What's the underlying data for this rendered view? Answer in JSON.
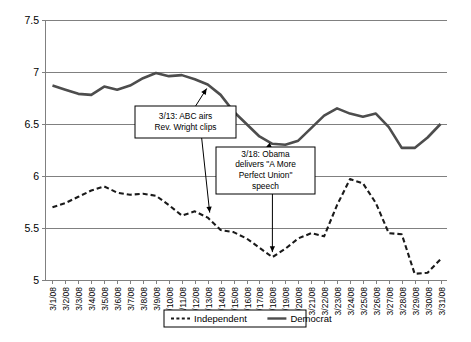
{
  "chart_data": {
    "type": "line",
    "title": "",
    "xlabel": "",
    "ylabel": "",
    "ylim": [
      5,
      7.5
    ],
    "ytick_step": 0.5,
    "yticks": [
      "5",
      "5.5",
      "6",
      "6.5",
      "7",
      "7.5"
    ],
    "grid": true,
    "legend_position": "bottom",
    "categories": [
      "3/1/08",
      "3/2/08",
      "3/3/08",
      "3/4/08",
      "3/5/08",
      "3/6/08",
      "3/7/08",
      "3/8/08",
      "3/9/08",
      "3/10/08",
      "3/11/08",
      "3/12/08",
      "3/13/08",
      "3/14/08",
      "3/15/08",
      "3/16/08",
      "3/17/08",
      "3/18/08",
      "3/19/08",
      "3/20/08",
      "3/21/08",
      "3/22/08",
      "3/23/08",
      "3/24/08",
      "3/25/08",
      "3/26/08",
      "3/27/08",
      "3/28/08",
      "3/29/08",
      "3/30/08",
      "3/31/08"
    ],
    "series": [
      {
        "name": "Independent",
        "style": "dashed",
        "color": "#1a1a1a",
        "values": [
          5.7,
          5.74,
          5.8,
          5.86,
          5.9,
          5.84,
          5.82,
          5.83,
          5.81,
          5.72,
          5.62,
          5.66,
          5.6,
          5.48,
          5.46,
          5.4,
          5.31,
          5.22,
          5.3,
          5.4,
          5.45,
          5.42,
          5.72,
          5.97,
          5.93,
          5.74,
          5.45,
          5.44,
          5.06,
          5.07,
          5.2
        ]
      },
      {
        "name": "Democrat",
        "style": "solid",
        "color": "#4d4d4d",
        "values": [
          6.87,
          6.83,
          6.79,
          6.78,
          6.86,
          6.83,
          6.87,
          6.94,
          6.99,
          6.96,
          6.97,
          6.93,
          6.88,
          6.78,
          6.62,
          6.5,
          6.38,
          6.31,
          6.3,
          6.34,
          6.46,
          6.58,
          6.65,
          6.6,
          6.57,
          6.6,
          6.47,
          6.27,
          6.27,
          6.37,
          6.5
        ]
      }
    ],
    "annotations": [
      {
        "id": "abc-wright-clips",
        "text_lines": [
          "3/13: ABC  airs",
          "Rev. Wright  clips"
        ],
        "target_category": "3/13/08",
        "target_series": "Democrat",
        "target_value": 6.88
      },
      {
        "id": "obama-speech",
        "text_lines": [
          "3/18: Obama",
          "delivers \"A More",
          "Perfect Union\"",
          "speech"
        ],
        "target_category": "3/18/08",
        "target_series_primary": "Democrat",
        "target_value_primary": 6.31,
        "target_series_secondary": "Independent",
        "target_value_secondary": 5.22
      }
    ],
    "legend": [
      {
        "label": "Independent",
        "style": "dashed",
        "color": "#1a1a1a"
      },
      {
        "label": "Democrat",
        "style": "solid",
        "color": "#4d4d4d"
      }
    ]
  }
}
